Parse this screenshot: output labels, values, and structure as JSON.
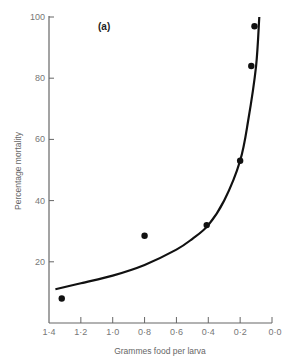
{
  "chart_data": {
    "type": "scatter",
    "title": "",
    "panel_label": "(a)",
    "xlabel": "Grammes food per larva",
    "ylabel": "Percentage mortality",
    "x_reversed": true,
    "xlim": [
      1.4,
      0.0
    ],
    "ylim": [
      0,
      100
    ],
    "x_ticks": [
      "1·4",
      "1·2",
      "1·0",
      "0·8",
      "0·6",
      "0·4",
      "0·2",
      "0·0"
    ],
    "x_tick_values": [
      1.4,
      1.2,
      1.0,
      0.8,
      0.6,
      0.4,
      0.2,
      0.0
    ],
    "y_ticks": [
      "20",
      "40",
      "60",
      "80",
      "100"
    ],
    "y_tick_values": [
      20,
      40,
      60,
      80,
      100
    ],
    "grid": false,
    "legend": null,
    "series": [
      {
        "name": "observed",
        "kind": "points",
        "x": [
          1.32,
          0.8,
          0.41,
          0.2,
          0.13,
          0.11
        ],
        "y": [
          8,
          28.5,
          32,
          53,
          84,
          97
        ]
      },
      {
        "name": "fitted curve",
        "kind": "line",
        "x": [
          1.36,
          1.2,
          1.0,
          0.8,
          0.6,
          0.5,
          0.4,
          0.3,
          0.2,
          0.15,
          0.1,
          0.08
        ],
        "y": [
          11,
          13,
          15.5,
          19,
          24,
          27.5,
          32,
          40,
          53,
          66,
          84,
          100
        ]
      }
    ]
  }
}
